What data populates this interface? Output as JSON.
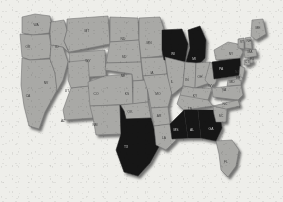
{
  "map": {
    "title": "United States choropleth map",
    "region": "Contiguous United States (lower 48)",
    "projection": "albers-usa-like",
    "legend": {
      "highlighted_label": "Highlighted states",
      "plain_label": "Other states"
    },
    "colors": {
      "background": "#eeeeea",
      "state_plain_fill": "#a9a9a6",
      "state_highlight_fill": "#121212",
      "state_border": "#6f6f6f",
      "label_plain": "#3b3b3b",
      "label_on_highlight": "#c9c9c9",
      "drop_shadow": "#4a4a4a"
    },
    "counts": {
      "highlighted": 7,
      "plain": 42,
      "total": 49
    },
    "highlighted_states": [
      "WI",
      "MI",
      "PA",
      "TX",
      "MS",
      "AL",
      "GA"
    ],
    "states": [
      {
        "code": "WA",
        "name": "Washington",
        "highlighted": false,
        "lx": 36,
        "ly": 26
      },
      {
        "code": "OR",
        "name": "Oregon",
        "highlighted": false,
        "lx": 28,
        "ly": 48
      },
      {
        "code": "CA",
        "name": "California",
        "highlighted": false,
        "lx": 28,
        "ly": 97
      },
      {
        "code": "NV",
        "name": "Nevada",
        "highlighted": false,
        "lx": 46,
        "ly": 84
      },
      {
        "code": "ID",
        "name": "Idaho",
        "highlighted": false,
        "lx": 57,
        "ly": 48
      },
      {
        "code": "MT",
        "name": "Montana",
        "highlighted": false,
        "lx": 87,
        "ly": 32
      },
      {
        "code": "WY",
        "name": "Wyoming",
        "highlighted": false,
        "lx": 88,
        "ly": 62
      },
      {
        "code": "UT",
        "name": "Utah",
        "highlighted": false,
        "lx": 67,
        "ly": 92
      },
      {
        "code": "AZ",
        "name": "Arizona",
        "highlighted": false,
        "lx": 63,
        "ly": 122
      },
      {
        "code": "CO",
        "name": "Colorado",
        "highlighted": false,
        "lx": 96,
        "ly": 95
      },
      {
        "code": "NM",
        "name": "New Mexico",
        "highlighted": false,
        "lx": 95,
        "ly": 126
      },
      {
        "code": "ND",
        "name": "North Dakota",
        "highlighted": false,
        "lx": 123,
        "ly": 40
      },
      {
        "code": "SD",
        "name": "South Dakota",
        "highlighted": false,
        "lx": 124,
        "ly": 58
      },
      {
        "code": "NE",
        "name": "Nebraska",
        "highlighted": false,
        "lx": 123,
        "ly": 77
      },
      {
        "code": "KS",
        "name": "Kansas",
        "highlighted": false,
        "lx": 127,
        "ly": 95
      },
      {
        "code": "OK",
        "name": "Oklahoma",
        "highlighted": false,
        "lx": 130,
        "ly": 113
      },
      {
        "code": "TX",
        "name": "Texas",
        "highlighted": true,
        "lx": 126,
        "ly": 148
      },
      {
        "code": "MN",
        "name": "Minnesota",
        "highlighted": false,
        "lx": 149,
        "ly": 44
      },
      {
        "code": "IA",
        "name": "Iowa",
        "highlighted": false,
        "lx": 152,
        "ly": 74
      },
      {
        "code": "MO",
        "name": "Missouri",
        "highlighted": false,
        "lx": 158,
        "ly": 95
      },
      {
        "code": "AR",
        "name": "Arkansas",
        "highlighted": false,
        "lx": 159,
        "ly": 117
      },
      {
        "code": "LA",
        "name": "Louisiana",
        "highlighted": false,
        "lx": 164,
        "ly": 139
      },
      {
        "code": "WI",
        "name": "Wisconsin",
        "highlighted": true,
        "lx": 173,
        "ly": 55
      },
      {
        "code": "IL",
        "name": "Illinois",
        "highlighted": false,
        "lx": 172,
        "ly": 83
      },
      {
        "code": "MI",
        "name": "Michigan",
        "highlighted": true,
        "lx": 194,
        "ly": 60
      },
      {
        "code": "IN",
        "name": "Indiana",
        "highlighted": false,
        "lx": 187,
        "ly": 81
      },
      {
        "code": "OH",
        "name": "Ohio",
        "highlighted": false,
        "lx": 200,
        "ly": 78
      },
      {
        "code": "KY",
        "name": "Kentucky",
        "highlighted": false,
        "lx": 195,
        "ly": 97
      },
      {
        "code": "TN",
        "name": "Tennessee",
        "highlighted": false,
        "lx": 190,
        "ly": 110
      },
      {
        "code": "MS",
        "name": "Mississippi",
        "highlighted": true,
        "lx": 176,
        "ly": 131
      },
      {
        "code": "AL",
        "name": "Alabama",
        "highlighted": true,
        "lx": 192,
        "ly": 131
      },
      {
        "code": "GA",
        "name": "Georgia",
        "highlighted": true,
        "lx": 211,
        "ly": 130
      },
      {
        "code": "FL",
        "name": "Florida",
        "highlighted": false,
        "lx": 226,
        "ly": 163
      },
      {
        "code": "SC",
        "name": "South Carolina",
        "highlighted": false,
        "lx": 221,
        "ly": 117
      },
      {
        "code": "NC",
        "name": "North Carolina",
        "highlighted": false,
        "lx": 225,
        "ly": 105
      },
      {
        "code": "VA",
        "name": "Virginia",
        "highlighted": false,
        "lx": 224,
        "ly": 91
      },
      {
        "code": "WV",
        "name": "West Virginia",
        "highlighted": false,
        "lx": 211,
        "ly": 87
      },
      {
        "code": "MD",
        "name": "Maryland",
        "highlighted": false,
        "lx": 232,
        "ly": 83
      },
      {
        "code": "DE",
        "name": "Delaware",
        "highlighted": false,
        "lx": 238,
        "ly": 79
      },
      {
        "code": "PA",
        "name": "Pennsylvania",
        "highlighted": true,
        "lx": 221,
        "ly": 70
      },
      {
        "code": "NJ",
        "name": "New Jersey",
        "highlighted": false,
        "lx": 237,
        "ly": 73
      },
      {
        "code": "NY",
        "name": "New York",
        "highlighted": false,
        "lx": 231,
        "ly": 55
      },
      {
        "code": "CT",
        "name": "Connecticut",
        "highlighted": false,
        "lx": 247,
        "ly": 63
      },
      {
        "code": "RI",
        "name": "Rhode Island",
        "highlighted": false,
        "lx": 252,
        "ly": 60
      },
      {
        "code": "MA",
        "name": "Massachusetts",
        "highlighted": false,
        "lx": 250,
        "ly": 53
      },
      {
        "code": "VT",
        "name": "Vermont",
        "highlighted": false,
        "lx": 242,
        "ly": 43
      },
      {
        "code": "NH",
        "name": "New Hampshire",
        "highlighted": false,
        "lx": 249,
        "ly": 42
      },
      {
        "code": "ME",
        "name": "Maine",
        "highlighted": false,
        "lx": 258,
        "ly": 29
      }
    ]
  }
}
